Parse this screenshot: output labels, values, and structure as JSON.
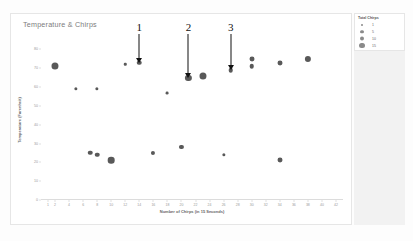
{
  "chart_panel": {
    "title": "Temperature & Chirps"
  },
  "legend": {
    "title": "Total Chirps",
    "entries": [
      {
        "label": "1",
        "size": 2.2
      },
      {
        "label": "5",
        "size": 3.6
      },
      {
        "label": "10",
        "size": 4.8
      },
      {
        "label": "15",
        "size": 5.8
      }
    ]
  },
  "annotations": [
    {
      "label": "1",
      "x": 14,
      "y": 73
    },
    {
      "label": "2",
      "x": 21,
      "y": 65
    },
    {
      "label": "3",
      "x": 27,
      "y": 69
    }
  ],
  "chart_data": {
    "type": "scatter",
    "title": "Temperature & Chirps",
    "xlabel": "Number of Chirps (in 15 Seconds)",
    "ylabel": "Temperature (Farenheit)",
    "xlim": [
      0,
      43
    ],
    "ylim": [
      0,
      85
    ],
    "grid": false,
    "legend_position": "right",
    "xticks": [
      1,
      2,
      4,
      6,
      8,
      10,
      12,
      14,
      16,
      18,
      20,
      22,
      24,
      26,
      28,
      30,
      32,
      34,
      36,
      38,
      40,
      42
    ],
    "yticks": [
      0,
      10,
      20,
      30,
      40,
      50,
      60,
      70,
      80
    ],
    "size_legend": "Total Chirps",
    "points": [
      {
        "x": 2,
        "y": 71,
        "size": 13
      },
      {
        "x": 5,
        "y": 59,
        "size": 4
      },
      {
        "x": 7,
        "y": 25,
        "size": 7
      },
      {
        "x": 8,
        "y": 24,
        "size": 7
      },
      {
        "x": 8,
        "y": 59,
        "size": 4
      },
      {
        "x": 10,
        "y": 21,
        "size": 12
      },
      {
        "x": 12,
        "y": 72,
        "size": 2
      },
      {
        "x": 14,
        "y": 73,
        "size": 7
      },
      {
        "x": 16,
        "y": 25,
        "size": 6
      },
      {
        "x": 18,
        "y": 57,
        "size": 3
      },
      {
        "x": 20,
        "y": 28,
        "size": 6
      },
      {
        "x": 21,
        "y": 65,
        "size": 11
      },
      {
        "x": 23,
        "y": 66,
        "size": 13
      },
      {
        "x": 26,
        "y": 24,
        "size": 4
      },
      {
        "x": 27,
        "y": 69,
        "size": 7
      },
      {
        "x": 30,
        "y": 75,
        "size": 8
      },
      {
        "x": 30,
        "y": 71,
        "size": 7
      },
      {
        "x": 34,
        "y": 21,
        "size": 8
      },
      {
        "x": 34,
        "y": 73,
        "size": 8
      },
      {
        "x": 38,
        "y": 75,
        "size": 11
      }
    ]
  }
}
